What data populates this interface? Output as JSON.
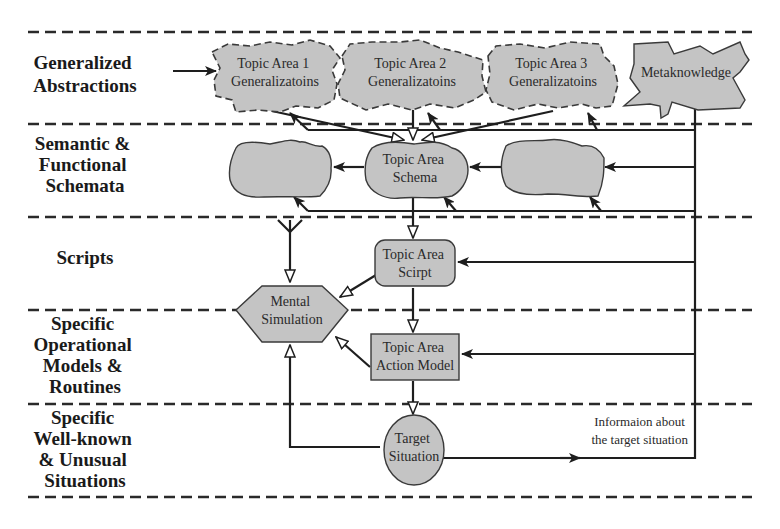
{
  "levels": [
    {
      "id": "generalized",
      "lines": [
        "Generalized",
        "Abstractions"
      ]
    },
    {
      "id": "semantic",
      "lines": [
        "Semantic &",
        "Functional",
        "Schemata"
      ]
    },
    {
      "id": "scripts",
      "lines": [
        "Scripts"
      ]
    },
    {
      "id": "operational",
      "lines": [
        "Specific",
        "Operational",
        "Models &",
        "Routines"
      ]
    },
    {
      "id": "situations",
      "lines": [
        "Specific",
        "Well-known",
        "& Unusual",
        "Situations"
      ]
    }
  ],
  "nodes": {
    "topic1": {
      "line1": "Topic Area 1",
      "line2": "Generalizatoins"
    },
    "topic2": {
      "line1": "Topic Area 2",
      "line2": "Generalizatoins"
    },
    "topic3": {
      "line1": "Topic Area 3",
      "line2": "Generalizatoins"
    },
    "meta": {
      "label": "Metaknowledge"
    },
    "schema": {
      "line1": "Topic Area",
      "line2": "Schema"
    },
    "script": {
      "line1": "Topic Area",
      "line2": "Scirpt"
    },
    "mental": {
      "line1": "Mental",
      "line2": "Simulation"
    },
    "action": {
      "line1": "Topic Area",
      "line2": "Action Model"
    },
    "target": {
      "line1": "Target",
      "line2": "Situation"
    }
  },
  "annotation": {
    "line1": "Informaion about",
    "line2": "the target situation"
  },
  "colors": {
    "node_fill": "#c4c4c4",
    "stroke": "#1e1e1e",
    "background": "#ffffff"
  }
}
